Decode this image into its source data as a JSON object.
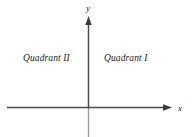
{
  "figure": {
    "type": "cartesian-coordinate-plane",
    "background_color": "#ffffff",
    "axis_color": "#444444",
    "lower_axis_color": "#9a9a9a",
    "text_color": "#1a1a1a",
    "labels": {
      "quadrant_1": "Quadrant I",
      "quadrant_2": "Quadrant II",
      "x_axis": "x",
      "y_axis": "y"
    },
    "geometry": {
      "origin_x": 88,
      "origin_y": 107,
      "x_axis_start_x": 7,
      "x_axis_arrow_tip_x": 172,
      "y_axis_arrow_tip_y": 17,
      "y_axis_bottom_y": 137
    }
  }
}
